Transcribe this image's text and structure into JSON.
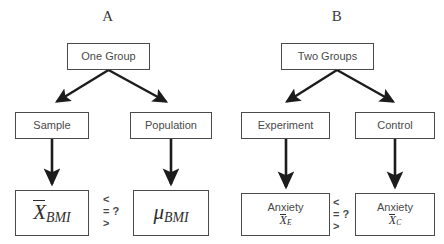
{
  "figure": {
    "panels": [
      {
        "id": "A",
        "label": "A",
        "root": {
          "label": "One Group"
        },
        "children": [
          {
            "label": "Sample"
          },
          {
            "label": "Population"
          }
        ],
        "statistics": [
          {
            "prefix": "",
            "symbol": "X",
            "overbar": true,
            "subscript": "BMI"
          },
          {
            "prefix": "",
            "symbol": "μ",
            "overbar": false,
            "subscript": "BMI"
          }
        ],
        "comparison": {
          "less": "<",
          "equal": "= ?",
          "greater": ">"
        }
      },
      {
        "id": "B",
        "label": "B",
        "root": {
          "label": "Two Groups"
        },
        "children": [
          {
            "label": "Experiment"
          },
          {
            "label": "Control"
          }
        ],
        "statistics": [
          {
            "prefix": "Anxiety",
            "symbol": "X",
            "overbar": true,
            "subscript": "E"
          },
          {
            "prefix": "Anxiety",
            "symbol": "X",
            "overbar": true,
            "subscript": "C"
          }
        ],
        "comparison": {
          "less": "<",
          "equal": "= ?",
          "greater": ">"
        }
      }
    ],
    "colors": {
      "box_border": "#4a4a4a",
      "arrow": "#1c1c1c",
      "text": "#4a4a4a",
      "background": "#ffffff"
    }
  }
}
